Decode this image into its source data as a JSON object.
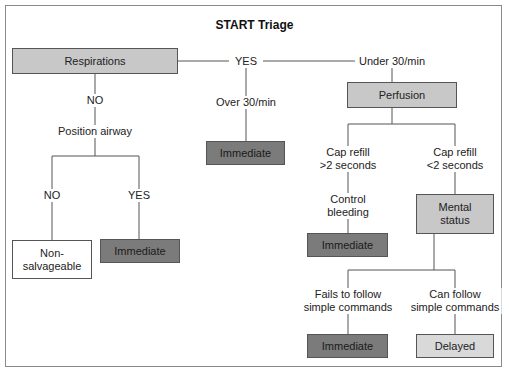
{
  "title": "START Triage",
  "nodes": {
    "respirations": "Respirations",
    "perfusion": "Perfusion",
    "mental_status": "Mental\nstatus",
    "immediate_airway_yes": "Immediate",
    "non_salvageable": "Non-\nsalvageable",
    "immediate_over_30": "Immediate",
    "immediate_control_bleeding": "Immediate",
    "immediate_fails_commands": "Immediate",
    "delayed": "Delayed"
  },
  "labels": {
    "resp_yes": "YES",
    "resp_no": "NO",
    "position_airway": "Position airway",
    "airway_no": "NO",
    "airway_yes": "YES",
    "over_30": "Over 30/min",
    "under_30": "Under 30/min",
    "cap_refill_gt2_line1": "Cap refill",
    "cap_refill_gt2_line2": ">2 seconds",
    "cap_refill_lt2_line1": "Cap refill",
    "cap_refill_lt2_line2": "<2 seconds",
    "control_bleeding_line1": "Control",
    "control_bleeding_line2": "bleeding",
    "fails_line1": "Fails to follow",
    "fails_line2": "simple commands",
    "can_line1": "Can follow",
    "can_line2": "simple commands"
  },
  "colors": {
    "decision_box": "#c8c8c8",
    "immediate_box": "#7b7b7b",
    "delayed_box": "#d9d9d9",
    "non_salvageable_box": "#ffffff",
    "line": "#555555"
  }
}
